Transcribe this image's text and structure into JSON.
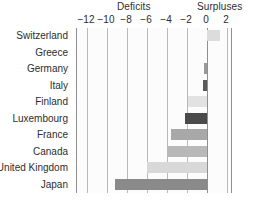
{
  "chart_data": {
    "type": "bar",
    "orientation": "horizontal",
    "title": "",
    "xlabel": "",
    "ylabel": "",
    "xlim": [
      -13,
      2.6
    ],
    "grid": true,
    "legend": "none",
    "band_labels": {
      "left": "Deficits",
      "right": "Surpluses"
    },
    "ticks": [
      {
        "label": "−12",
        "value": -12
      },
      {
        "label": "−10",
        "value": -10
      },
      {
        "label": "−8",
        "value": -8
      },
      {
        "label": "−6",
        "value": -6
      },
      {
        "label": "−4",
        "value": -4
      },
      {
        "label": "−2",
        "value": -2
      },
      {
        "label": "0",
        "value": 0
      },
      {
        "label": "2",
        "value": 2
      }
    ],
    "categories": [
      "Switzerland",
      "Greece",
      "Germany",
      "Italy",
      "Finland",
      "Luxembourg",
      "France",
      "Canada",
      "United Kingdom",
      "Japan"
    ],
    "values": [
      1.3,
      0.0,
      -0.3,
      -0.4,
      -1.9,
      -2.2,
      -3.6,
      -4.0,
      -6.0,
      -9.2
    ],
    "bar_colors": [
      "#dcdcdc",
      "#dcdcdc",
      "#9a9a9a",
      "#5a5a5a",
      "#e2e2e2",
      "#4a4a4a",
      "#a8a8a8",
      "#b8b8b8",
      "#d8d8d8",
      "#8a8a8a"
    ]
  },
  "colors": {
    "axis": "#8f8f8f",
    "gridline": "#b9b9b9",
    "text": "#2d2d2d",
    "plot_background": "#fcfcfc"
  },
  "source_note": ""
}
